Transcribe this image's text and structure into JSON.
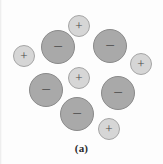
{
  "figure": {
    "caption": "(a)",
    "background_color": "#fdfdfd",
    "width": 163,
    "height": 164,
    "negative_fill": "#a9a9a9",
    "negative_stroke": "#8a8a8a",
    "positive_fill": "#d6d6d6",
    "positive_stroke": "#a5a5a5",
    "sign_color": "#4a4a4a",
    "particles": [
      {
        "id": "positive-1",
        "sign": "+",
        "charge": "positive",
        "cx": 79,
        "cy": 26,
        "r": 11
      },
      {
        "id": "negative-1",
        "sign": "−",
        "charge": "negative",
        "cx": 58,
        "cy": 47,
        "r": 17
      },
      {
        "id": "negative-2",
        "sign": "−",
        "charge": "negative",
        "cx": 110,
        "cy": 46,
        "r": 17
      },
      {
        "id": "positive-2",
        "sign": "+",
        "charge": "positive",
        "cx": 24,
        "cy": 56,
        "r": 11
      },
      {
        "id": "positive-3",
        "sign": "+",
        "charge": "positive",
        "cx": 141,
        "cy": 64,
        "r": 11
      },
      {
        "id": "positive-4",
        "sign": "+",
        "charge": "positive",
        "cx": 79,
        "cy": 78,
        "r": 11
      },
      {
        "id": "negative-3",
        "sign": "−",
        "charge": "negative",
        "cx": 46,
        "cy": 90,
        "r": 17
      },
      {
        "id": "negative-4",
        "sign": "−",
        "charge": "negative",
        "cx": 118,
        "cy": 93,
        "r": 17
      },
      {
        "id": "negative-5",
        "sign": "−",
        "charge": "negative",
        "cx": 77,
        "cy": 114,
        "r": 17
      },
      {
        "id": "positive-5",
        "sign": "+",
        "charge": "positive",
        "cx": 109,
        "cy": 129,
        "r": 11
      }
    ]
  }
}
